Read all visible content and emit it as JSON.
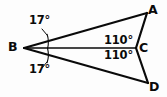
{
  "figure": {
    "type": "geometry-diagram",
    "background_color": "#fdfdfd",
    "stroke_color": "#0a0a0a",
    "vertices": [
      {
        "id": "A",
        "label": "A",
        "x": 147,
        "y": 13
      },
      {
        "id": "B",
        "label": "B",
        "x": 24,
        "y": 48
      },
      {
        "id": "C",
        "label": "C",
        "x": 135,
        "y": 48
      },
      {
        "id": "D",
        "label": "D",
        "x": 148,
        "y": 83
      }
    ],
    "segments": [
      {
        "id": "BA",
        "from": "B",
        "to": "A"
      },
      {
        "id": "BC",
        "from": "B",
        "to": "C"
      },
      {
        "id": "BD",
        "from": "B",
        "to": "D"
      },
      {
        "id": "AC",
        "from": "A",
        "to": "C"
      },
      {
        "id": "CD",
        "from": "C",
        "to": "D"
      }
    ],
    "angles": [
      {
        "id": "angle-ABC",
        "vertex": "B",
        "label": "17°",
        "value": 17,
        "unit": "degrees",
        "position": "upper-left"
      },
      {
        "id": "angle-CBD",
        "vertex": "B",
        "label": "17°",
        "value": 17,
        "unit": "degrees",
        "position": "lower-left"
      },
      {
        "id": "angle-BCA",
        "vertex": "C",
        "label": "110°",
        "value": 110,
        "unit": "degrees",
        "position": "upper-right"
      },
      {
        "id": "angle-BCD",
        "vertex": "C",
        "label": "110°",
        "value": 110,
        "unit": "degrees",
        "position": "lower-right"
      }
    ]
  }
}
